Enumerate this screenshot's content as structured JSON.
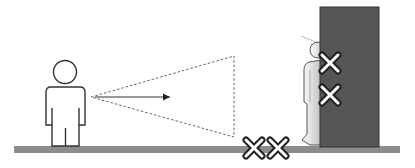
{
  "diagram": {
    "description": "Observer looking toward a wall; a person hides behind a dark pillar; X marks indicate blind/prohibited spots",
    "elements": {
      "observer": {
        "label": "observer",
        "role": "standing person viewing right"
      },
      "vision_cone": {
        "label": "field of view",
        "style": "dashed"
      },
      "view_arrow": {
        "label": "line of sight"
      },
      "pillar": {
        "label": "pillar",
        "color": "#555555"
      },
      "hidden_person": {
        "label": "person hiding behind pillar"
      },
      "ground": {
        "label": "floor",
        "color": "#8c8c8c"
      },
      "x_marks": [
        {
          "id": "pillar-upper",
          "position": "on pillar, upper"
        },
        {
          "id": "pillar-lower",
          "position": "on pillar, lower"
        },
        {
          "id": "floor-left",
          "position": "on floor, left"
        },
        {
          "id": "floor-right",
          "position": "on floor, right"
        }
      ]
    },
    "colors": {
      "outline": "#333333",
      "pillar": "#555555",
      "ground": "#8c8c8c",
      "x_fill": "#ffffff",
      "x_stroke": "#222222"
    }
  }
}
